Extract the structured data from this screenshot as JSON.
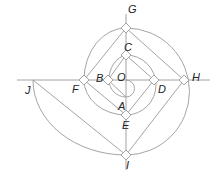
{
  "diagram": {
    "type": "geometric spiral construction",
    "stroke_color": "#9a9a9a",
    "label_color": "#222222",
    "points": [
      {
        "id": "G",
        "label": "G",
        "x": 126,
        "y": 28,
        "lx": 128,
        "ly": 4
      },
      {
        "id": "C",
        "label": "C",
        "x": 126,
        "y": 55,
        "lx": 124,
        "ly": 42
      },
      {
        "id": "B",
        "label": "B",
        "x": 108,
        "y": 80,
        "lx": 96,
        "ly": 73
      },
      {
        "id": "O",
        "label": "O",
        "x": 126,
        "y": 80,
        "lx": 117,
        "ly": 72
      },
      {
        "id": "D",
        "label": "D",
        "x": 154,
        "y": 80,
        "lx": 158,
        "ly": 84
      },
      {
        "id": "H",
        "label": "H",
        "x": 184,
        "y": 80,
        "lx": 192,
        "ly": 72
      },
      {
        "id": "F",
        "label": "F",
        "x": 84,
        "y": 80,
        "lx": 72,
        "ly": 84
      },
      {
        "id": "J",
        "label": "J",
        "x": 33,
        "y": 80,
        "lx": 25,
        "ly": 85
      },
      {
        "id": "A",
        "label": "A",
        "x": 126,
        "y": 97,
        "lx": 118,
        "ly": 101
      },
      {
        "id": "E",
        "label": "E",
        "x": 126,
        "y": 115,
        "lx": 122,
        "ly": 120
      },
      {
        "id": "I",
        "label": "I",
        "x": 126,
        "y": 155,
        "lx": 126,
        "ly": 160
      }
    ],
    "segments": [
      [
        "B",
        "C"
      ],
      [
        "C",
        "D"
      ],
      [
        "D",
        "E"
      ],
      [
        "B",
        "A"
      ],
      [
        "F",
        "G"
      ],
      [
        "G",
        "H"
      ],
      [
        "H",
        "I"
      ],
      [
        "F",
        "E"
      ],
      [
        "J",
        "I"
      ]
    ],
    "right_angle_marks": [
      "C",
      "B",
      "D",
      "E",
      "F",
      "G",
      "H",
      "I"
    ]
  }
}
